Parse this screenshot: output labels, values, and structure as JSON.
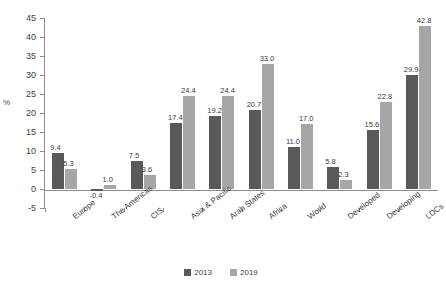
{
  "chart_data": {
    "type": "bar",
    "title": "",
    "xlabel": "",
    "ylabel": "%",
    "ylim": [
      -5,
      45
    ],
    "ytick_step": 5,
    "yticks": [
      45,
      40,
      35,
      30,
      25,
      20,
      15,
      10,
      5,
      0,
      -5
    ],
    "grid": false,
    "legend_position": "bottom",
    "categories": [
      "Europe",
      "The Americas",
      "CIS",
      "Asia & Pacific",
      "Arab States",
      "Africa",
      "World",
      "Developed",
      "Developing",
      "LDCs"
    ],
    "series": [
      {
        "name": "2013",
        "color": "#595959",
        "values": [
          9.4,
          -0.4,
          7.5,
          17.4,
          19.2,
          20.7,
          11.0,
          5.8,
          15.6,
          29.9
        ],
        "labels": [
          "9.4",
          "-0.4",
          "7.5",
          "17.4",
          "19.2",
          "20.7",
          "11.0",
          "5.8",
          "15.6",
          "29.9"
        ]
      },
      {
        "name": "2019",
        "color": "#a6a6a6",
        "values": [
          5.3,
          1.0,
          3.6,
          24.4,
          24.4,
          33.0,
          17.0,
          2.3,
          22.8,
          42.8
        ],
        "labels": [
          "5.3",
          "1.0",
          "3.6",
          "24.4",
          "24.4",
          "33.0",
          "17.0",
          "2.3",
          "22.8",
          "42.8"
        ]
      }
    ]
  },
  "legend": {
    "items": [
      {
        "label": "2013",
        "color": "#595959"
      },
      {
        "label": "2019",
        "color": "#a6a6a6"
      }
    ]
  }
}
